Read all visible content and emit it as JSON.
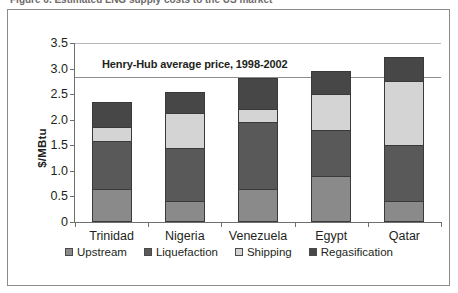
{
  "caption_sliver": "Figure 6. Estimated LNG supply costs to the US market",
  "chart_data": {
    "type": "bar",
    "stacked": true,
    "title": "",
    "xlabel": "",
    "ylabel": "$/MBtu",
    "ylim": [
      0,
      3.5
    ],
    "yticks": [
      "0",
      "0.5",
      "1.0",
      "1.5",
      "2.0",
      "2.5",
      "3.0",
      "3.5"
    ],
    "ytick_values": [
      0,
      0.5,
      1.0,
      1.5,
      2.0,
      2.5,
      3.0,
      3.5
    ],
    "grid": false,
    "legend_position": "bottom",
    "categories": [
      "Trinidad",
      "Nigeria",
      "Venezuela",
      "Egypt",
      "Qatar"
    ],
    "series": [
      {
        "name": "Upstream",
        "color": "#8a8a8a",
        "values": [
          0.65,
          0.42,
          0.64,
          0.9,
          0.42
        ]
      },
      {
        "name": "Liquefaction",
        "color": "#595959",
        "values": [
          0.96,
          1.04,
          1.34,
          0.92,
          1.11
        ]
      },
      {
        "name": "Shipping",
        "color": "#d4d4d4",
        "values": [
          0.29,
          0.72,
          0.26,
          0.72,
          1.26
        ]
      },
      {
        "name": "Regasification",
        "color": "#474747",
        "values": [
          0.51,
          0.43,
          0.64,
          0.47,
          0.49
        ]
      }
    ],
    "totals": [
      2.41,
      2.61,
      2.88,
      3.01,
      3.28
    ],
    "annotations": [
      {
        "name": "henry-hub-reference-line",
        "label": "Henry-Hub average price, 1998-2002",
        "value": 2.83,
        "color": "#8d8d8d"
      }
    ]
  },
  "legend": {
    "items": [
      {
        "label": "Upstream",
        "color": "#8a8a8a"
      },
      {
        "label": "Liquefaction",
        "color": "#595959"
      },
      {
        "label": "Shipping",
        "color": "#d4d4d4"
      },
      {
        "label": "Regasification",
        "color": "#474747"
      }
    ]
  }
}
